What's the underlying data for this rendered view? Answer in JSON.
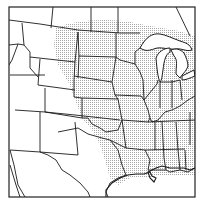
{
  "map": {
    "type": "range-map",
    "region": "Central and Eastern United States",
    "shading": "stippled distribution range",
    "colors": {
      "background": "#ffffff",
      "lines": "#1a1a1a",
      "stipple": "#9a9a9a",
      "frame": "#222222"
    },
    "labels": []
  },
  "caption": "Range map"
}
